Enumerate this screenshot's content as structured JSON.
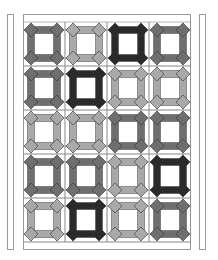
{
  "palette": {
    "black": "#2a2a2a",
    "dark": "#6f6f6f",
    "light": "#a9a9a9",
    "grid": "#8c8c8c",
    "background": "#ffffff"
  },
  "quilt": {
    "columns": 4,
    "rows": 5,
    "blocks": [
      [
        "dark",
        "light",
        "black",
        "dark"
      ],
      [
        "dark",
        "black",
        "light",
        "light"
      ],
      [
        "light",
        "light",
        "dark",
        "dark"
      ],
      [
        "dark",
        "dark",
        "light",
        "black"
      ],
      [
        "light",
        "black",
        "light",
        "dark"
      ]
    ]
  }
}
